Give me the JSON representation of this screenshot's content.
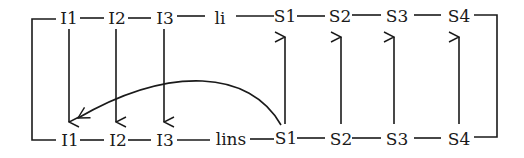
{
  "diagram": {
    "top_row": {
      "nodes": [
        {
          "id": "t_I1",
          "label": "I1",
          "x": 70
        },
        {
          "id": "t_I2",
          "label": "I2",
          "x": 118
        },
        {
          "id": "t_I3",
          "label": "I3",
          "x": 165
        },
        {
          "id": "t_li",
          "label": "li",
          "x": 222
        },
        {
          "id": "t_S1",
          "label": "S1",
          "x": 286
        },
        {
          "id": "t_S2",
          "label": "S2",
          "x": 342
        },
        {
          "id": "t_S3",
          "label": "S3",
          "x": 397
        },
        {
          "id": "t_S4",
          "label": "S4",
          "x": 459
        }
      ]
    },
    "bottom_row": {
      "nodes": [
        {
          "id": "b_I1",
          "label": "I1",
          "x": 70
        },
        {
          "id": "b_I2",
          "label": "I2",
          "x": 118
        },
        {
          "id": "b_I3",
          "label": "I3",
          "x": 165
        },
        {
          "id": "b_lins",
          "label": "lins",
          "x": 232
        },
        {
          "id": "b_S1",
          "label": "S1",
          "x": 286
        },
        {
          "id": "b_S2",
          "label": "S2",
          "x": 342
        },
        {
          "id": "b_S3",
          "label": "S3",
          "x": 397
        },
        {
          "id": "b_S4",
          "label": "S4",
          "x": 459
        }
      ]
    },
    "edges": [
      {
        "from": "t_I1",
        "to": "b_I1",
        "type": "down-arrow"
      },
      {
        "from": "t_I2",
        "to": "b_I2",
        "type": "down-arrow"
      },
      {
        "from": "t_I3",
        "to": "b_I3",
        "type": "down-arrow"
      },
      {
        "from": "b_S1",
        "to": "t_S1",
        "type": "up-arrow"
      },
      {
        "from": "b_S2",
        "to": "t_S2",
        "type": "up-arrow"
      },
      {
        "from": "b_S3",
        "to": "t_S3",
        "type": "up-arrow"
      },
      {
        "from": "b_S4",
        "to": "t_S4",
        "type": "up-arrow"
      },
      {
        "from": "b_S1",
        "to": "b_I1",
        "type": "curved-arrow"
      }
    ]
  }
}
